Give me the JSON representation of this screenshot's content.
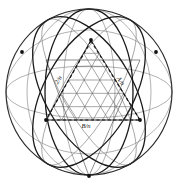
{
  "figure": {
    "background_color": "#ffffff",
    "ink_color": "#101010",
    "light_ink_color": "#6b6b6b",
    "mid_ink_color": "#4a4a4a"
  },
  "outer_circle": {
    "name": "bounding-circle",
    "cx": 89,
    "cy": 92,
    "r": 83,
    "stroke": "#2b2b2b",
    "stroke_width": 1.1
  },
  "great_circle_arcs": {
    "note": "Heavy elliptical great circles of the sphere",
    "stroke": "#1a1a1a",
    "stroke_width": 1.3,
    "ellipses": [
      {
        "name": "great-circle-vertical-left",
        "cx": 89,
        "cy": 92,
        "rx": 44,
        "ry": 83,
        "rot": 0
      },
      {
        "name": "great-circle-tilted-a",
        "cx": 89,
        "cy": 92,
        "rx": 83,
        "ry": 44,
        "rot": 60
      },
      {
        "name": "great-circle-tilted-b",
        "cx": 89,
        "cy": 92,
        "rx": 83,
        "ry": 44,
        "rot": -60
      }
    ]
  },
  "light_lattice": {
    "note": "Faint construction ellipses of the spherical lattice",
    "stroke": "#7c7c7c",
    "stroke_width": 0.6,
    "ellipses": [
      {
        "name": "lattice-ellipse-1",
        "cx": 89,
        "cy": 92,
        "rx": 83,
        "ry": 26,
        "rot": 0
      },
      {
        "name": "lattice-ellipse-2",
        "cx": 89,
        "cy": 92,
        "rx": 26,
        "ry": 83,
        "rot": 0
      },
      {
        "name": "lattice-ellipse-3",
        "cx": 89,
        "cy": 92,
        "rx": 83,
        "ry": 26,
        "rot": 60
      },
      {
        "name": "lattice-ellipse-4",
        "cx": 89,
        "cy": 92,
        "rx": 83,
        "ry": 26,
        "rot": -60
      },
      {
        "name": "lattice-ellipse-5",
        "cx": 89,
        "cy": 92,
        "rx": 83,
        "ry": 62,
        "rot": 0
      },
      {
        "name": "lattice-ellipse-6",
        "cx": 89,
        "cy": 92,
        "rx": 62,
        "ry": 83,
        "rot": 0
      }
    ]
  },
  "vertices": [
    {
      "name": "vertex-top",
      "x": 91,
      "y": 40,
      "marker": true
    },
    {
      "name": "vertex-left",
      "x": 46,
      "y": 120,
      "marker": true
    },
    {
      "name": "vertex-right",
      "x": 140,
      "y": 120,
      "marker": true
    },
    {
      "name": "vertex-bottom",
      "x": 89,
      "y": 176,
      "marker": true
    },
    {
      "name": "vertex-upper-left",
      "x": 22,
      "y": 52,
      "marker": true
    },
    {
      "name": "vertex-upper-right",
      "x": 156,
      "y": 52,
      "marker": true
    }
  ],
  "main_triangle": {
    "name": "primary-spherical-triangle",
    "stroke": "#3a3a3a",
    "stroke_width": 0.8,
    "points": "91,40 46,120 140,120"
  },
  "inverted_triangle": {
    "name": "secondary-spherical-triangle",
    "stroke": "#5a5a5a",
    "stroke_width": 0.7,
    "points": "89,176 46,60 140,60"
  },
  "mesh": {
    "name": "triangular-subdivision-mesh",
    "stroke": "#5e5e5e",
    "stroke_width": 0.55,
    "frequency": 6,
    "description": "Fine triangular subdivision grid over lower-central triangle region"
  },
  "dashed_lines": [
    {
      "name": "dashed-chord-left",
      "x1": 91,
      "y1": 41,
      "x2": 46,
      "y2": 120,
      "label_key": "labels.0"
    },
    {
      "name": "dashed-chord-right",
      "x1": 91,
      "y1": 41,
      "x2": 140,
      "y2": 120,
      "label_key": "labels.1"
    },
    {
      "name": "dashed-chord-bottom",
      "x1": 46,
      "y1": 120,
      "x2": 140,
      "y2": 120,
      "label_key": "labels.2"
    }
  ],
  "labels": [
    {
      "name": "label-left-chord",
      "text": "2/n",
      "x": 60,
      "y": 81,
      "rotate": -58
    },
    {
      "name": "label-right-chord",
      "text": "A/n",
      "x": 119,
      "y": 82,
      "rotate": 58
    },
    {
      "name": "label-bottom-chord",
      "text": "B/n",
      "x": 86,
      "y": 128,
      "rotate": 0
    }
  ],
  "dash_style": {
    "stroke": "#141414",
    "stroke_width": 1.2,
    "dasharray": "3.2,2.4"
  }
}
